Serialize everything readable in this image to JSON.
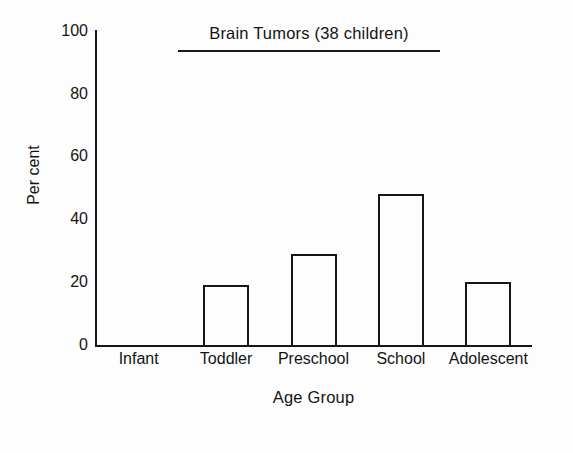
{
  "chart_data": {
    "type": "bar",
    "title": "Brain Tumors (38 children)",
    "xlabel": "Age Group",
    "ylabel": "Per cent",
    "categories": [
      "Infant",
      "Toddler",
      "Preschool",
      "School",
      "Adolescent"
    ],
    "values": [
      0,
      19,
      29,
      48,
      20
    ],
    "ylim": [
      0,
      100
    ],
    "yticks": [
      0,
      20,
      40,
      60,
      80,
      100
    ],
    "ytick_labels": [
      "0",
      "20",
      "40",
      "60",
      "80",
      "100"
    ],
    "grid": false,
    "legend": null,
    "bar_style": "outlined-hollow",
    "colors": {
      "bar_outline": "#161616",
      "bar_fill": "none",
      "axis": "#161616",
      "text": "#141414",
      "background": "#fdfdfd"
    },
    "annotations": [
      "Title is underlined with a horizontal rule",
      "Infant category has no bar (value 0)"
    ]
  }
}
